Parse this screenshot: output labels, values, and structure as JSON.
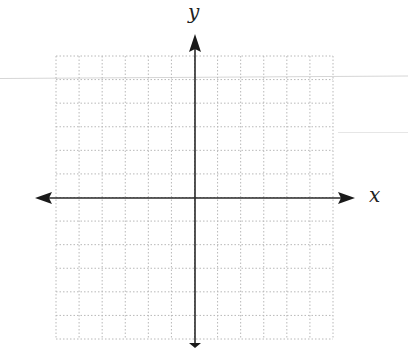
{
  "diagram": {
    "type": "coordinate-plane",
    "axes": {
      "x_label": "x",
      "y_label": "y",
      "arrows": "both-ends"
    },
    "grid": {
      "columns": 12,
      "rows": 12,
      "style": "dotted",
      "color": "#b8b8b8"
    },
    "colors": {
      "axis": "#2a2a2a",
      "grid": "#b8b8b8",
      "background": "#ffffff"
    }
  }
}
